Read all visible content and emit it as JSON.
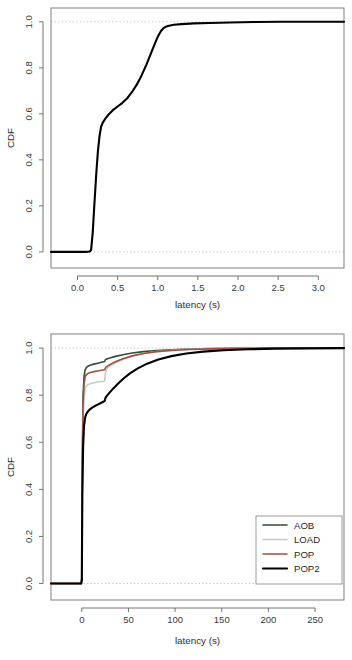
{
  "chart_data": [
    {
      "id": "top",
      "type": "line",
      "title": "",
      "xlabel": "latency (s)",
      "ylabel": "CDF",
      "xlim": [
        -0.33,
        3.32
      ],
      "ylim": [
        -0.07,
        1.06
      ],
      "xticks": [
        0.0,
        0.5,
        1.0,
        1.5,
        2.0,
        2.5,
        3.0
      ],
      "xticklabels": [
        "0.0",
        "0.5",
        "1.0",
        "1.5",
        "2.0",
        "2.5",
        "3.0"
      ],
      "yticks": [
        0.0,
        0.2,
        0.4,
        0.6,
        0.8,
        1.0
      ],
      "yticklabels": [
        "0.0",
        "0.2",
        "0.4",
        "0.6",
        "0.8",
        "1.0"
      ],
      "grid": false,
      "reference_lines": [
        {
          "axis": "y",
          "value": 0.0,
          "style": "dotted",
          "color": "#c9c9c9"
        },
        {
          "axis": "y",
          "value": 1.0,
          "style": "dotted",
          "color": "#c9c9c9"
        }
      ],
      "legend": null,
      "series": [
        {
          "name": "latency CDF",
          "color": "#000000",
          "width": 2.1,
          "x": [
            -0.33,
            0.1,
            0.155,
            0.17,
            0.19,
            0.21,
            0.235,
            0.255,
            0.275,
            0.295,
            0.315,
            0.345,
            0.385,
            0.44,
            0.5,
            0.56,
            0.62,
            0.68,
            0.74,
            0.8,
            0.86,
            0.91,
            0.96,
            1.0,
            1.04,
            1.07,
            1.1,
            1.14,
            1.2,
            1.3,
            1.45,
            1.65,
            1.9,
            2.2,
            2.55,
            2.9,
            3.32
          ],
          "y": [
            0.0,
            0.0,
            0.002,
            0.01,
            0.085,
            0.205,
            0.345,
            0.44,
            0.505,
            0.545,
            0.562,
            0.578,
            0.596,
            0.616,
            0.632,
            0.648,
            0.668,
            0.695,
            0.728,
            0.768,
            0.815,
            0.858,
            0.902,
            0.935,
            0.96,
            0.972,
            0.979,
            0.983,
            0.987,
            0.99,
            0.993,
            0.995,
            0.997,
            0.999,
            1.0,
            1.0,
            1.0
          ]
        }
      ]
    },
    {
      "id": "bottom",
      "type": "line",
      "title": "",
      "xlabel": "latency (s)",
      "ylabel": "CDF",
      "xlim": [
        -33,
        281
      ],
      "ylim": [
        -0.07,
        1.06
      ],
      "xticks": [
        0,
        50,
        100,
        150,
        200,
        250
      ],
      "xticklabels": [
        "0",
        "50",
        "100",
        "150",
        "200",
        "250"
      ],
      "yticks": [
        0.0,
        0.2,
        0.4,
        0.6,
        0.8,
        1.0
      ],
      "yticklabels": [
        "0.0",
        "0.2",
        "0.4",
        "0.6",
        "0.8",
        "1.0"
      ],
      "grid": false,
      "reference_lines": [
        {
          "axis": "y",
          "value": 0.0,
          "style": "dotted",
          "color": "#c9c9c9"
        },
        {
          "axis": "y",
          "value": 1.0,
          "style": "dotted",
          "color": "#c9c9c9"
        }
      ],
      "legend": {
        "position": "bottom-right",
        "entries": [
          {
            "label": "AOB",
            "color": "#2f4f3a"
          },
          {
            "label": "LOAD",
            "color": "#c2ccc4"
          },
          {
            "label": "POP",
            "color": "#a0503f"
          },
          {
            "label": "POP2",
            "color": "#000000"
          }
        ]
      },
      "series": [
        {
          "name": "AOB",
          "color": "#2f4f3a",
          "width": 1.6,
          "x": [
            -33,
            -0.6,
            0.0,
            0.6,
            1.4,
            2.4,
            3.6,
            5.0,
            7.0,
            9.5,
            13,
            17,
            21,
            24.5,
            25.5,
            30,
            36,
            44,
            54,
            66,
            80,
            96,
            115,
            138,
            165,
            200,
            240,
            281
          ],
          "y": [
            0.0,
            0.0,
            0.02,
            0.54,
            0.8,
            0.88,
            0.908,
            0.918,
            0.924,
            0.928,
            0.932,
            0.936,
            0.94,
            0.943,
            0.952,
            0.958,
            0.965,
            0.972,
            0.979,
            0.985,
            0.99,
            0.993,
            0.996,
            0.998,
            0.999,
            1.0,
            1.0,
            1.0
          ]
        },
        {
          "name": "LOAD",
          "color": "#c2ccc4",
          "width": 1.6,
          "x": [
            -33,
            -0.6,
            0.0,
            0.6,
            1.4,
            2.4,
            3.6,
            5.0,
            7.0,
            9.5,
            13,
            17,
            21,
            24.5,
            25.5,
            26.5,
            30,
            36,
            44,
            54,
            66,
            80,
            96,
            115,
            138,
            165,
            200,
            240,
            281
          ],
          "y": [
            0.0,
            0.0,
            0.018,
            0.48,
            0.7,
            0.795,
            0.828,
            0.84,
            0.846,
            0.85,
            0.853,
            0.856,
            0.858,
            0.86,
            0.9,
            0.912,
            0.924,
            0.938,
            0.952,
            0.966,
            0.977,
            0.985,
            0.991,
            0.995,
            0.998,
            0.999,
            1.0,
            1.0,
            1.0
          ]
        },
        {
          "name": "POP",
          "color": "#a0503f",
          "width": 1.6,
          "x": [
            -33,
            -0.6,
            0.0,
            0.6,
            1.4,
            2.4,
            3.6,
            5.0,
            7.0,
            9.5,
            13,
            17,
            21,
            24.5,
            25.5,
            30,
            36,
            44,
            54,
            66,
            80,
            96,
            115,
            138,
            165,
            200,
            240,
            281
          ],
          "y": [
            0.0,
            0.0,
            0.02,
            0.51,
            0.76,
            0.848,
            0.878,
            0.888,
            0.893,
            0.897,
            0.9,
            0.903,
            0.906,
            0.908,
            0.918,
            0.93,
            0.942,
            0.955,
            0.967,
            0.977,
            0.985,
            0.99,
            0.994,
            0.997,
            0.999,
            1.0,
            1.0,
            1.0
          ]
        },
        {
          "name": "POP2",
          "color": "#000000",
          "width": 2.1,
          "x": [
            -33,
            -0.6,
            0.0,
            0.6,
            1.4,
            2.4,
            3.6,
            5.0,
            7.0,
            9.0,
            11.5,
            14,
            17,
            20,
            23,
            24.5,
            25.5,
            27,
            30,
            34,
            39,
            45,
            52,
            60,
            70,
            82,
            96,
            112,
            130,
            152,
            178,
            208,
            243,
            281
          ],
          "y": [
            0.0,
            0.0,
            0.015,
            0.38,
            0.58,
            0.67,
            0.706,
            0.722,
            0.733,
            0.741,
            0.748,
            0.754,
            0.76,
            0.766,
            0.772,
            0.776,
            0.79,
            0.798,
            0.812,
            0.83,
            0.85,
            0.872,
            0.894,
            0.914,
            0.934,
            0.952,
            0.966,
            0.977,
            0.985,
            0.991,
            0.995,
            0.998,
            0.999,
            1.0
          ]
        }
      ]
    }
  ]
}
